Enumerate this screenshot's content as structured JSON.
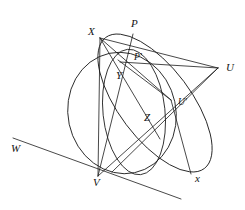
{
  "figure": {
    "background_color": "#ffffff",
    "stroke_color": "#1a1a1a",
    "width": 245,
    "height": 210,
    "labels": [
      {
        "id": "X",
        "text": "X",
        "x": 88,
        "y": 35
      },
      {
        "id": "P",
        "text": "P",
        "x": 131,
        "y": 27
      },
      {
        "id": "Pp",
        "text": "P'",
        "x": 134,
        "y": 60
      },
      {
        "id": "U",
        "text": "U",
        "x": 226,
        "y": 71
      },
      {
        "id": "Y",
        "text": "Y",
        "x": 116,
        "y": 79
      },
      {
        "id": "Up",
        "text": "U'",
        "x": 178,
        "y": 105
      },
      {
        "id": "Z",
        "text": "Z",
        "x": 144,
        "y": 121
      },
      {
        "id": "W",
        "text": "W",
        "x": 11,
        "y": 152
      },
      {
        "id": "V",
        "text": "V",
        "x": 93,
        "y": 186
      },
      {
        "id": "x",
        "text": "x",
        "x": 195,
        "y": 182
      }
    ],
    "points": {
      "X": {
        "x": 100,
        "y": 38
      },
      "P": {
        "x": 133,
        "y": 34
      },
      "Pp": {
        "x": 132,
        "y": 55
      },
      "U": {
        "x": 218,
        "y": 68
      },
      "Y": {
        "x": 121,
        "y": 66
      },
      "Up": {
        "x": 171,
        "y": 100
      },
      "Z": {
        "x": 152,
        "y": 120
      },
      "V": {
        "x": 98,
        "y": 176
      },
      "K": {
        "x": 160,
        "y": 139
      },
      "Wstart": {
        "x": 13,
        "y": 138
      },
      "Wend": {
        "x": 181,
        "y": 199
      },
      "xend": {
        "x": 191,
        "y": 174
      }
    },
    "conics": [
      {
        "name": "large-ellipse",
        "desc": "tilted ellipse through P, U, V"
      },
      {
        "name": "circle",
        "desc": "circle through V, Y region"
      },
      {
        "name": "inner-ellipse",
        "desc": "narrow ellipse through V and P'"
      }
    ]
  }
}
